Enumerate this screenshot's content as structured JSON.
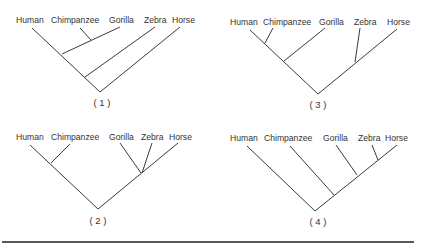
{
  "figure": {
    "rule_color": "#222222",
    "trees": [
      {
        "caption": "( 1 )",
        "labels": [
          {
            "text": "Human",
            "x": 16,
            "y": 23
          },
          {
            "text": "Chimpanzee",
            "x": 51,
            "y": 23
          },
          {
            "text": "Gorilla",
            "x": 109,
            "y": 23
          },
          {
            "text": "Zebra",
            "x": 144,
            "y": 23
          },
          {
            "text": "Horse",
            "x": 172,
            "y": 23
          }
        ],
        "caption_pos": {
          "x": 102,
          "y": 106
        },
        "edges": [
          [
            32,
            28,
            100,
            92
          ],
          [
            80,
            28,
            91,
            40
          ],
          [
            120,
            27,
            62,
            54
          ],
          [
            155,
            27,
            85,
            77
          ],
          [
            180,
            27,
            100,
            92
          ]
        ]
      },
      {
        "caption": "( 3 )",
        "labels": [
          {
            "text": "Human",
            "x": 230,
            "y": 25
          },
          {
            "text": "Chimpanzee",
            "x": 263,
            "y": 25
          },
          {
            "text": "Gorilla",
            "x": 319,
            "y": 25
          },
          {
            "text": "Zebra",
            "x": 354,
            "y": 25
          },
          {
            "text": "Horse",
            "x": 387,
            "y": 25
          }
        ],
        "caption_pos": {
          "x": 318,
          "y": 108
        },
        "edges": [
          [
            250,
            30,
            318,
            94
          ],
          [
            273,
            28,
            265,
            43
          ],
          [
            325,
            28,
            284,
            61
          ],
          [
            360,
            28,
            355,
            62
          ],
          [
            397,
            29,
            318,
            94
          ]
        ]
      },
      {
        "caption": "( 2 )",
        "labels": [
          {
            "text": "Human",
            "x": 16,
            "y": 140
          },
          {
            "text": "Chimpanzee",
            "x": 51,
            "y": 140
          },
          {
            "text": "Gorilla",
            "x": 109,
            "y": 140
          },
          {
            "text": "Zebra",
            "x": 141,
            "y": 140
          },
          {
            "text": "Horse",
            "x": 169,
            "y": 140
          }
        ],
        "caption_pos": {
          "x": 98,
          "y": 224
        },
        "edges": [
          [
            30,
            145,
            98,
            209
          ],
          [
            70,
            144,
            51,
            163
          ],
          [
            120,
            143,
            141,
            173
          ],
          [
            152,
            143,
            142,
            173
          ],
          [
            178,
            143,
            98,
            209
          ]
        ]
      },
      {
        "caption": "( 4 )",
        "labels": [
          {
            "text": "Human",
            "x": 230,
            "y": 141
          },
          {
            "text": "Chimpanzee",
            "x": 264,
            "y": 141
          },
          {
            "text": "Gorilla",
            "x": 323,
            "y": 141
          },
          {
            "text": "Zebra",
            "x": 358,
            "y": 141
          },
          {
            "text": "Horse",
            "x": 385,
            "y": 141
          }
        ],
        "caption_pos": {
          "x": 318,
          "y": 225
        },
        "edges": [
          [
            247,
            146,
            315,
            211
          ],
          [
            290,
            146,
            334,
            195
          ],
          [
            336,
            145,
            357,
            175
          ],
          [
            372,
            145,
            378,
            160
          ],
          [
            397,
            145,
            315,
            211
          ]
        ]
      }
    ],
    "rule": [
      2,
      242,
      414,
      242
    ]
  }
}
